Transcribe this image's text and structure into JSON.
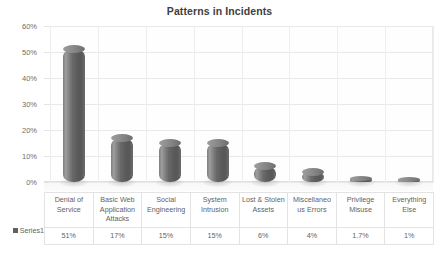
{
  "chart_data": {
    "type": "bar",
    "title": "Patterns in Incidents",
    "xlabel": "",
    "ylabel": "",
    "ylim": [
      0,
      60
    ],
    "ytick_labels": [
      "60%",
      "50%",
      "40%",
      "30%",
      "20%",
      "10%",
      "0%"
    ],
    "ytick_values": [
      60,
      50,
      40,
      30,
      20,
      10,
      0
    ],
    "grid": true,
    "legend_position": "bottom-left-table",
    "categories": [
      "Denial of Service",
      "Basic Web Application Attacks",
      "Social Engineering",
      "System Intrusion",
      "Lost & Stolen Assets",
      "Miscellaneous Errors",
      "Privilege Misuse",
      "Everything Else"
    ],
    "category_labels": [
      "Denial of Service",
      "Basic Web Application Attacks",
      "Social Engineering",
      "System Intrusion",
      "Lost & Stolen Assets",
      "Miscellaneo us Errors",
      "Privilege Misuse",
      "Everything Else"
    ],
    "value_labels": [
      "51%",
      "17%",
      "15%",
      "15%",
      "6%",
      "4%",
      "1.7%",
      "1%"
    ],
    "values": [
      51,
      17,
      15,
      15,
      6,
      4,
      1.7,
      1
    ],
    "series": [
      {
        "name": "Series1",
        "values": [
          51,
          17,
          15,
          15,
          6,
          4,
          1.7,
          1
        ]
      }
    ],
    "colors": {
      "bar": "#5c5c5c",
      "bar_highlight": "#9d9d9d",
      "title": "#404040",
      "text": "#5f5f5f",
      "gridline": "#e9e9e9",
      "plot_background": "#ffffff"
    }
  },
  "legend": {
    "series_label": "Series1"
  }
}
